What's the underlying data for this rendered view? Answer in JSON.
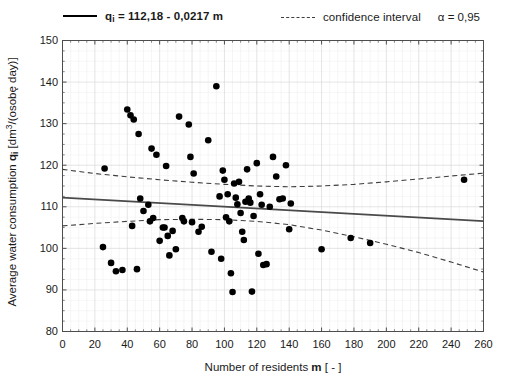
{
  "legend": {
    "regression_label_prefix": "q",
    "regression_label_sub": "i",
    "regression_label": " = 112,18 - 0,0217 m",
    "ci_label": "confidence interval",
    "alpha_label": "α = 0,95",
    "regression_swatch": "solid-line-swatch",
    "ci_swatch": "dashed-line-swatch"
  },
  "axes": {
    "ylabel_pre": "Average water consumption ",
    "ylabel_q": "q",
    "ylabel_q_sub": "i",
    "ylabel_unit_pre": " [dm",
    "ylabel_unit_sup": "3",
    "ylabel_unit_post": "/(osobę day)]",
    "xlabel_pre": "Number of residents ",
    "xlabel_m": "m",
    "xlabel_post": " [ - ]"
  },
  "chart_data": {
    "type": "scatter",
    "title": "",
    "xlabel": "Number of residents m [ - ]",
    "ylabel": "Average water consumption q_i [dm3/(osobę day)]",
    "xlim": [
      0,
      260
    ],
    "ylim": [
      80,
      150
    ],
    "xticks": [
      0,
      20,
      40,
      60,
      80,
      100,
      120,
      140,
      160,
      180,
      200,
      220,
      240,
      260
    ],
    "yticks": [
      80,
      90,
      100,
      110,
      120,
      130,
      140,
      150
    ],
    "xminor_step": 5,
    "yminor_step": 2.5,
    "grid": true,
    "grid_color": "#d8d8d8",
    "legend_position": "above-plot",
    "marker": {
      "shape": "circle",
      "color": "#000000",
      "size": 4.4
    },
    "regression": {
      "name": "q_i = 112,18 - 0,0217 m",
      "intercept": 112.18,
      "slope": -0.0217,
      "style": "solid",
      "color": "#4a4a4a",
      "endpoints": [
        [
          0,
          112.18
        ],
        [
          260,
          106.54
        ]
      ]
    },
    "confidence_interval": {
      "name": "confidence interval",
      "alpha": 0.95,
      "style": "dashed",
      "color": "#3d3d3d",
      "upper": [
        [
          0,
          119.0
        ],
        [
          20,
          118.0
        ],
        [
          40,
          117.2
        ],
        [
          60,
          116.5
        ],
        [
          80,
          115.9
        ],
        [
          100,
          115.4
        ],
        [
          120,
          115.0
        ],
        [
          140,
          114.8
        ],
        [
          160,
          115.0
        ],
        [
          180,
          115.4
        ],
        [
          200,
          116.0
        ],
        [
          220,
          116.7
        ],
        [
          240,
          117.4
        ],
        [
          260,
          118.1
        ]
      ],
      "lower": [
        [
          0,
          105.4
        ],
        [
          20,
          106.0
        ],
        [
          40,
          106.5
        ],
        [
          60,
          106.9
        ],
        [
          80,
          107.0
        ],
        [
          100,
          106.9
        ],
        [
          120,
          106.5
        ],
        [
          140,
          105.7
        ],
        [
          160,
          104.4
        ],
        [
          180,
          102.8
        ],
        [
          200,
          101.0
        ],
        [
          220,
          99.0
        ],
        [
          240,
          96.7
        ],
        [
          260,
          94.3
        ]
      ]
    },
    "points": [
      [
        25,
        100.3
      ],
      [
        26,
        119.2
      ],
      [
        30,
        96.5
      ],
      [
        33,
        94.5
      ],
      [
        37,
        94.8
      ],
      [
        40,
        133.4
      ],
      [
        42,
        132.0
      ],
      [
        43,
        105.4
      ],
      [
        44,
        131.0
      ],
      [
        46,
        95.0
      ],
      [
        47,
        127.5
      ],
      [
        48,
        112.0
      ],
      [
        50,
        109.0
      ],
      [
        53,
        110.5
      ],
      [
        54,
        106.5
      ],
      [
        55,
        124.0
      ],
      [
        56,
        107.3
      ],
      [
        58,
        122.5
      ],
      [
        60,
        101.8
      ],
      [
        62,
        105.0
      ],
      [
        63,
        105.0
      ],
      [
        64,
        119.8
      ],
      [
        65,
        103.0
      ],
      [
        66,
        98.3
      ],
      [
        68,
        104.2
      ],
      [
        70,
        99.8
      ],
      [
        72,
        131.7
      ],
      [
        74,
        107.3
      ],
      [
        75,
        106.5
      ],
      [
        78,
        129.8
      ],
      [
        79,
        122.0
      ],
      [
        80,
        106.3
      ],
      [
        81,
        118.0
      ],
      [
        84,
        104.0
      ],
      [
        86,
        105.2
      ],
      [
        90,
        126.0
      ],
      [
        92,
        99.2
      ],
      [
        95,
        139.0
      ],
      [
        97,
        112.5
      ],
      [
        98,
        97.5
      ],
      [
        99,
        118.7
      ],
      [
        100,
        116.5
      ],
      [
        101,
        107.5
      ],
      [
        102,
        113.0
      ],
      [
        103,
        106.5
      ],
      [
        104,
        94.0
      ],
      [
        105,
        89.5
      ],
      [
        106,
        115.6
      ],
      [
        107,
        112.2
      ],
      [
        108,
        110.6
      ],
      [
        109,
        116.0
      ],
      [
        110,
        108.5
      ],
      [
        111,
        104.0
      ],
      [
        112,
        102.0
      ],
      [
        113,
        111.2
      ],
      [
        114,
        119.0
      ],
      [
        115,
        112.0
      ],
      [
        116,
        111.0
      ],
      [
        117,
        89.6
      ],
      [
        118,
        107.8
      ],
      [
        120,
        120.5
      ],
      [
        121,
        98.7
      ],
      [
        122,
        113.0
      ],
      [
        123,
        110.5
      ],
      [
        124,
        96.0
      ],
      [
        126,
        96.2
      ],
      [
        128,
        110.0
      ],
      [
        130,
        122.0
      ],
      [
        132,
        117.3
      ],
      [
        134,
        111.8
      ],
      [
        136,
        112.0
      ],
      [
        138,
        120.0
      ],
      [
        140,
        104.6
      ],
      [
        141,
        110.8
      ],
      [
        160,
        99.8
      ],
      [
        178,
        102.5
      ],
      [
        190,
        101.3
      ],
      [
        248,
        116.5
      ]
    ]
  }
}
